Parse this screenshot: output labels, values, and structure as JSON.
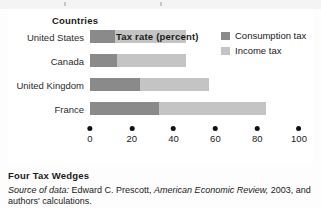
{
  "figure": {
    "y_axis_head": "Countries",
    "axis_title": "Tax rate (percent)",
    "caption_title": "Four Tax Wedges",
    "source_label": "Source of data:",
    "source_author": "Edward C. Prescott,",
    "source_journal": "American Economic Review,",
    "source_year": "2003,",
    "source_tail": "and authors' calculations."
  },
  "legend": {
    "items": [
      {
        "label": "Consumption tax",
        "color": "#8a8a8a",
        "name": "consumption-tax"
      },
      {
        "label": "Income tax",
        "color": "#c4c4c4",
        "name": "income-tax"
      }
    ]
  },
  "chart_data": {
    "type": "bar",
    "orientation": "horizontal",
    "stacked": true,
    "title": "Four Tax Wedges",
    "xlabel": "Tax rate (percent)",
    "ylabel": "Countries",
    "xlim": [
      0,
      100
    ],
    "xticks": [
      0,
      20,
      40,
      60,
      80,
      100
    ],
    "grid": false,
    "legend_position": "right",
    "categories": [
      "United States",
      "Canada",
      "United Kingdom",
      "France"
    ],
    "series": [
      {
        "name": "Consumption tax",
        "color": "#8a8a8a",
        "values": [
          12,
          13,
          24,
          33
        ]
      },
      {
        "name": "Income tax",
        "color": "#c4c4c4",
        "values": [
          34,
          33,
          33,
          51
        ]
      }
    ],
    "totals": [
      46,
      46,
      57,
      84
    ]
  }
}
